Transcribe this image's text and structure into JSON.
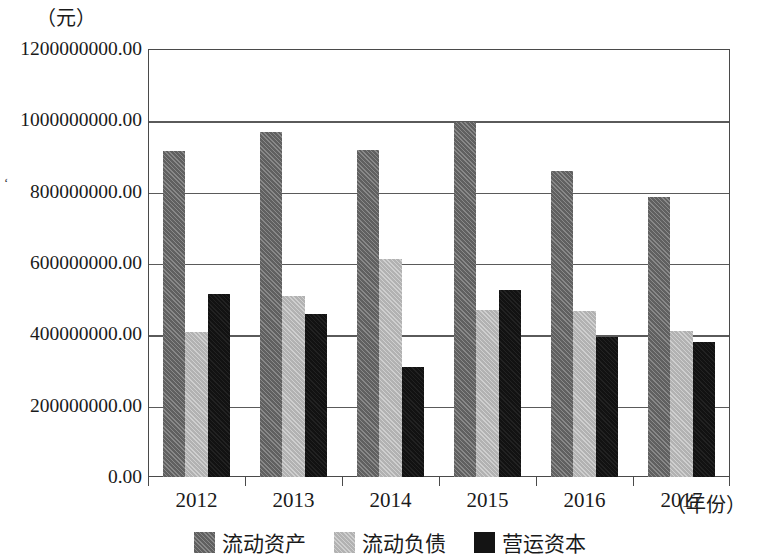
{
  "chart_data": {
    "type": "bar",
    "title": "",
    "subtitle": "",
    "xlabel": "（年份）",
    "ylabel": "（元）",
    "categories": [
      "2012",
      "2013",
      "2014",
      "2015",
      "2016",
      "2017"
    ],
    "series": [
      {
        "name": "流动资产",
        "color": "#6b6b6b",
        "values": [
          914000000,
          967000000,
          917000000,
          995000000,
          858000000,
          785000000
        ]
      },
      {
        "name": "流动负债",
        "color": "#bdbdbd",
        "values": [
          407000000,
          508000000,
          610000000,
          468000000,
          465000000,
          409000000
        ]
      },
      {
        "name": "营运资本",
        "color": "#141414",
        "values": [
          513000000,
          457000000,
          308000000,
          524000000,
          393000000,
          378000000
        ]
      }
    ],
    "ylim": [
      0,
      1200000000
    ],
    "ytick_labels": [
      "0.00",
      "200000000.00",
      "400000000.00",
      "600000000.00",
      "800000000.00",
      "1000000000.00",
      "1200000000.00"
    ],
    "ytick_values": [
      0,
      200000000,
      400000000,
      600000000,
      800000000,
      1000000000,
      1200000000
    ],
    "grid": true,
    "grid_axis": "y",
    "legend_position": "bottom-center"
  },
  "axis": {
    "y_unit_label": "（元）",
    "x_axis_title": "（年份）"
  },
  "legend": {
    "items": [
      {
        "label": "流动资产",
        "swatch": "dark-gray-hatched-swatch"
      },
      {
        "label": "流动负债",
        "swatch": "light-gray-hatched-swatch"
      },
      {
        "label": "营运资本",
        "swatch": "black-swatch"
      }
    ]
  },
  "artifacts": {
    "stray_mark": "‘"
  }
}
